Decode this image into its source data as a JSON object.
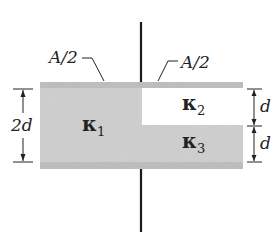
{
  "diagram": {
    "type": "capacitor-with-dielectrics",
    "labels": {
      "area_left": "A/2",
      "area_right": "A/2",
      "kappa1": "κ",
      "kappa1_sub": "1",
      "kappa2": "κ",
      "kappa2_sub": "2",
      "kappa3": "κ",
      "kappa3_sub": "3",
      "dim_left": "2d",
      "dim_right_top": "d",
      "dim_right_bottom": "d"
    },
    "colors": {
      "plate": "#bdbdbd",
      "dielectric_fill": "#cfcfcf",
      "empty_fill": "#ffffff",
      "wire": "#1a1a1a",
      "text": "#222222"
    }
  }
}
